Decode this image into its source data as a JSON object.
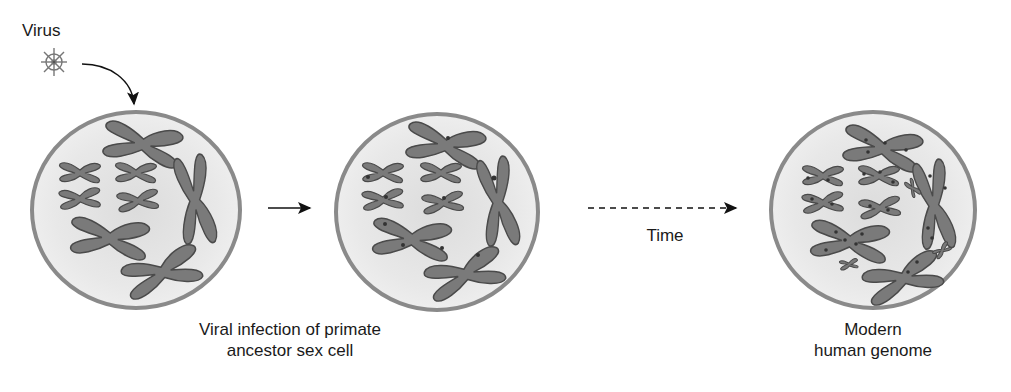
{
  "diagram": {
    "virus_label": "Virus",
    "time_label": "Time",
    "caption_infection_line1": "Viral infection of primate",
    "caption_infection_line2": "ancestor sex cell",
    "caption_modern_line1": "Modern",
    "caption_modern_line2": "human genome",
    "colors": {
      "cell_border": "#8a8a8a",
      "cell_fill": "#e6e6e6",
      "chromosome": "#7a7a7a",
      "chromosome_outline": "#4a4a4a",
      "marker": "#333333",
      "arrow": "#111111"
    },
    "stages": [
      {
        "name": "original-cell",
        "markers": false
      },
      {
        "name": "infected-cell",
        "markers": true
      },
      {
        "name": "modern-genome-cell",
        "markers": true
      }
    ]
  }
}
